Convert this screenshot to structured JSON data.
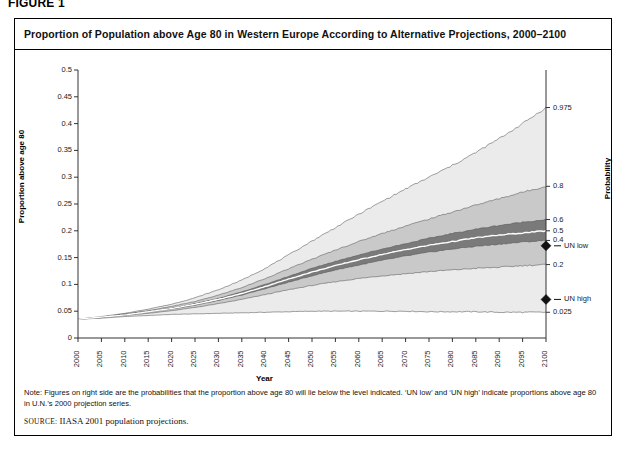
{
  "figure_label": "FIGURE 1",
  "title": "Proportion of Population above Age 80 in Western Europe According to Alternative Projections, 2000–2100",
  "axes": {
    "ylabel": "Proportion above age 80",
    "xlabel": "Year",
    "right_label": "Probability"
  },
  "markers": [
    {
      "name": "un-low",
      "label": "UN low",
      "value": 0.172
    },
    {
      "name": "un-high",
      "label": "UN high",
      "value": 0.072
    }
  ],
  "note": "Note: Figures on right side are the probabilities that the proportion above age 80 will lie below the level indicated. ‘UN low’ and ‘UN high’ indicate proportions above age 80 in U.N.’s 2000 projection series.",
  "source_prefix": "SOURCE:",
  "source_text": "IIASA 2001 population projections.",
  "colors": {
    "band_outer": "#ebebeb",
    "band_mid": "#c9c9c9",
    "band_inner": "#9d9d9d",
    "band_core": "#7a7a7a",
    "median_line": "#ffffff",
    "axis": "#3a3a3a",
    "frame": "#000000"
  },
  "chart_data": {
    "type": "area",
    "title": "Proportion of Population above Age 80 in Western Europe According to Alternative Projections, 2000–2100",
    "xlabel": "Year",
    "ylabel": "Proportion above age 80",
    "xlim": [
      2000,
      2100
    ],
    "ylim": [
      0,
      0.5
    ],
    "grid": false,
    "legend": "right-axis-probabilities",
    "xticks": [
      2000,
      2005,
      2010,
      2015,
      2020,
      2025,
      2030,
      2035,
      2040,
      2045,
      2050,
      2055,
      2060,
      2065,
      2070,
      2075,
      2080,
      2085,
      2090,
      2095,
      2100
    ],
    "yticks": [
      0,
      0.05,
      0.1,
      0.15,
      0.2,
      0.25,
      0.3,
      0.35,
      0.4,
      0.45,
      0.5
    ],
    "right_axis": {
      "label": "Probability",
      "ticks": [
        {
          "probability": "0.975",
          "value": 0.43
        },
        {
          "probability": "0.8",
          "value": 0.283
        },
        {
          "probability": "0.6",
          "value": 0.221
        },
        {
          "probability": "0.5",
          "value": 0.2
        },
        {
          "probability": "0.4",
          "value": 0.182
        },
        {
          "probability": "0.2",
          "value": 0.137
        },
        {
          "probability": "0.025",
          "value": 0.048
        }
      ]
    },
    "x": [
      2000,
      2005,
      2010,
      2015,
      2020,
      2025,
      2030,
      2035,
      2040,
      2045,
      2050,
      2055,
      2060,
      2065,
      2070,
      2075,
      2080,
      2085,
      2090,
      2095,
      2100
    ],
    "series": [
      {
        "name": "q0.025",
        "probability": 0.025,
        "values": [
          0.035,
          0.037,
          0.04,
          0.042,
          0.044,
          0.045,
          0.046,
          0.047,
          0.048,
          0.049,
          0.05,
          0.05,
          0.05,
          0.05,
          0.05,
          0.049,
          0.049,
          0.049,
          0.048,
          0.048,
          0.048
        ]
      },
      {
        "name": "q0.2",
        "probability": 0.2,
        "values": [
          0.035,
          0.038,
          0.042,
          0.046,
          0.051,
          0.057,
          0.064,
          0.072,
          0.081,
          0.09,
          0.098,
          0.105,
          0.111,
          0.116,
          0.12,
          0.124,
          0.127,
          0.13,
          0.132,
          0.135,
          0.137
        ]
      },
      {
        "name": "q0.4",
        "probability": 0.4,
        "values": [
          0.035,
          0.038,
          0.043,
          0.048,
          0.054,
          0.061,
          0.07,
          0.08,
          0.092,
          0.104,
          0.116,
          0.127,
          0.136,
          0.145,
          0.153,
          0.16,
          0.166,
          0.171,
          0.175,
          0.179,
          0.182
        ]
      },
      {
        "name": "q0.5_median",
        "probability": 0.5,
        "values": [
          0.035,
          0.039,
          0.043,
          0.049,
          0.055,
          0.063,
          0.072,
          0.083,
          0.096,
          0.11,
          0.123,
          0.135,
          0.146,
          0.156,
          0.165,
          0.173,
          0.18,
          0.187,
          0.192,
          0.196,
          0.2
        ]
      },
      {
        "name": "q0.6",
        "probability": 0.6,
        "values": [
          0.035,
          0.039,
          0.044,
          0.05,
          0.056,
          0.064,
          0.074,
          0.086,
          0.1,
          0.115,
          0.13,
          0.143,
          0.155,
          0.166,
          0.176,
          0.186,
          0.195,
          0.203,
          0.21,
          0.216,
          0.221
        ]
      },
      {
        "name": "q0.8",
        "probability": 0.8,
        "values": [
          0.035,
          0.039,
          0.045,
          0.051,
          0.059,
          0.068,
          0.08,
          0.094,
          0.111,
          0.129,
          0.147,
          0.164,
          0.18,
          0.195,
          0.209,
          0.222,
          0.235,
          0.248,
          0.26,
          0.272,
          0.283
        ]
      },
      {
        "name": "q0.975",
        "probability": 0.975,
        "values": [
          0.035,
          0.04,
          0.046,
          0.054,
          0.063,
          0.075,
          0.09,
          0.108,
          0.13,
          0.155,
          0.181,
          0.206,
          0.231,
          0.255,
          0.278,
          0.3,
          0.322,
          0.346,
          0.372,
          0.4,
          0.43
        ]
      }
    ],
    "markers": [
      {
        "label": "UN low",
        "value": 0.172,
        "x": 2100
      },
      {
        "label": "UN high",
        "value": 0.072,
        "x": 2100
      }
    ]
  }
}
